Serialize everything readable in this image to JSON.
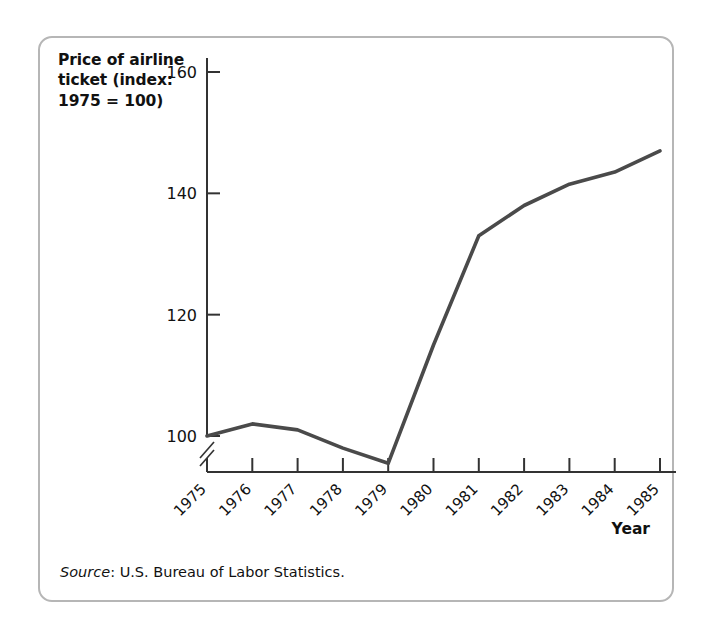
{
  "figure": {
    "axis_title_y": "Price of airline\nticket (index:\n1975 = 100)",
    "axis_title_x": "Year",
    "source_label": "Source",
    "source_separator": ": ",
    "source_text": "U.S. Bureau of Labor Statistics.",
    "border_color": "#b6b6b6",
    "line_color": "#4a4a4a",
    "axis_color": "#333333"
  },
  "chart_data": {
    "type": "line",
    "title": "",
    "xlabel": "Year",
    "ylabel": "Price of airline ticket (index: 1975 = 100)",
    "categories": [
      "1975",
      "1976",
      "1977",
      "1978",
      "1979",
      "1980",
      "1981",
      "1982",
      "1983",
      "1984",
      "1985"
    ],
    "x": [
      1975,
      1976,
      1977,
      1978,
      1979,
      1980,
      1981,
      1982,
      1983,
      1984,
      1985
    ],
    "values": [
      100,
      102,
      101,
      98,
      95.5,
      115,
      133,
      138,
      141.5,
      143.5,
      147
    ],
    "ytick_labels": [
      "100",
      "120",
      "140",
      "160"
    ],
    "yticks": [
      100,
      120,
      140,
      160
    ],
    "ylim": [
      92,
      168
    ],
    "axis_break": true,
    "grid": false,
    "legend": null,
    "xtick_rotation": -45
  }
}
